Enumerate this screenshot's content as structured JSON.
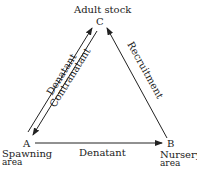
{
  "diagram": {
    "title": "Adult stock",
    "nodes": [
      {
        "id": "A",
        "label": "A",
        "caption_line1": "Spawning",
        "caption_line2": "area"
      },
      {
        "id": "B",
        "label": "B",
        "caption_line1": "Nursery",
        "caption_line2": "area"
      },
      {
        "id": "C",
        "label": "C",
        "caption": "Adult stock"
      }
    ],
    "edges": [
      {
        "from": "A",
        "to": "C",
        "label": "Denatant"
      },
      {
        "from": "C",
        "to": "A",
        "label": "Contranatant"
      },
      {
        "from": "B",
        "to": "C",
        "label": "Recruitment"
      },
      {
        "from": "A",
        "to": "B",
        "label": "Denatant"
      }
    ],
    "line_color": "#222222"
  }
}
